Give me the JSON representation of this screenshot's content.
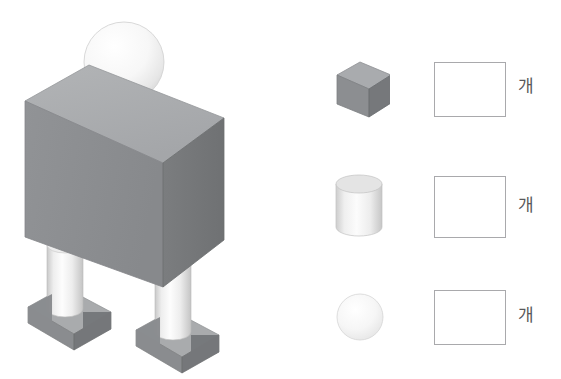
{
  "page": {
    "background_color": "#ffffff",
    "width": 561,
    "height": 379
  },
  "figure": {
    "name": "robot-figure",
    "parts": [
      {
        "name": "head-sphere",
        "shape": "sphere",
        "count": 1,
        "color": "#f2f2f2"
      },
      {
        "name": "neck-cylinder",
        "shape": "cylinder",
        "count": 1,
        "color": "#e9e9e9"
      },
      {
        "name": "body-box",
        "shape": "cuboid",
        "count": 1,
        "color": "#8d8f92"
      },
      {
        "name": "leg-cylinder",
        "shape": "cylinder",
        "count": 2,
        "color": "#e4e4e4"
      },
      {
        "name": "foot-box",
        "shape": "cuboid",
        "count": 2,
        "color": "#8d8f92"
      }
    ],
    "colors": {
      "box_top": "#adafb1",
      "box_front": "#8d8f92",
      "box_side": "#757779",
      "cylinder_light": "#fbfbfb",
      "cylinder_shade": "#d2d2d2",
      "sphere_light": "#fdfdfd",
      "sphere_shade": "#e3e3e3",
      "outline": "#9a9a9a"
    }
  },
  "answer_table": {
    "box_border_color": "#a9a9ac",
    "unit_text_color": "#58585a",
    "rows": [
      {
        "shape_name": "cube",
        "shape_type": "cuboid",
        "answer_value": "",
        "answer_placeholder": "",
        "unit_label": "개"
      },
      {
        "shape_name": "cylinder",
        "shape_type": "cylinder",
        "answer_value": "",
        "answer_placeholder": "",
        "unit_label": "개"
      },
      {
        "shape_name": "sphere",
        "shape_type": "sphere",
        "answer_value": "",
        "answer_placeholder": "",
        "unit_label": "개"
      }
    ]
  }
}
